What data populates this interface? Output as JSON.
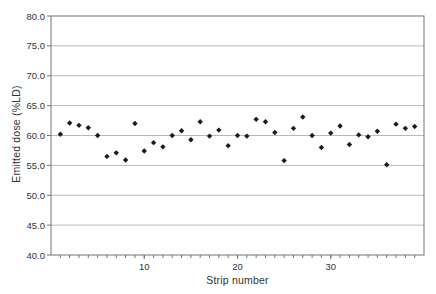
{
  "figure": {
    "kind": "scatter-chart-figure",
    "background": "#ffffff"
  },
  "chart_data": {
    "type": "scatter",
    "title": "",
    "xlabel": "Strip number",
    "ylabel": "Emitted dose (%LD)",
    "xlim": [
      0,
      40
    ],
    "ylim": [
      40,
      80
    ],
    "x_major_ticks": [
      10,
      20,
      30
    ],
    "x_major_tick_labels": [
      "10",
      "20",
      "30"
    ],
    "x_minor_tick_step": 1,
    "x_minor_tick_range": [
      1,
      39
    ],
    "y_ticks": [
      40,
      45,
      50,
      55,
      60,
      65,
      70,
      75,
      80
    ],
    "y_tick_labels": [
      "40.0",
      "45.0",
      "50.0",
      "55.0",
      "60.0",
      "65.0",
      "70.0",
      "75.0",
      "80.0"
    ],
    "grid": "horizontal",
    "legend": "none",
    "marker": "diamond",
    "series": [
      {
        "name": "Emitted dose per strip",
        "x": [
          1,
          2,
          3,
          4,
          5,
          6,
          7,
          8,
          9,
          10,
          11,
          12,
          13,
          14,
          15,
          16,
          17,
          18,
          19,
          20,
          21,
          22,
          23,
          24,
          25,
          26,
          27,
          28,
          29,
          30,
          31,
          32,
          33,
          34,
          35,
          36,
          37,
          38,
          39
        ],
        "y": [
          60.2,
          62.1,
          61.7,
          61.3,
          60.0,
          56.5,
          57.1,
          55.9,
          62.0,
          57.4,
          58.8,
          58.1,
          60.0,
          60.8,
          59.3,
          62.3,
          59.9,
          60.9,
          58.3,
          60.0,
          59.9,
          62.7,
          62.3,
          60.5,
          55.8,
          61.2,
          63.1,
          60.0,
          58.0,
          60.4,
          61.6,
          58.5,
          60.1,
          59.8,
          60.7,
          55.1,
          61.9,
          61.2,
          61.5
        ]
      }
    ],
    "colors": {
      "marker": "#1a1a1a",
      "gridline": "#b8b8b8",
      "axis": "#737373",
      "tick_text": "#333333",
      "background": "#ffffff"
    }
  }
}
